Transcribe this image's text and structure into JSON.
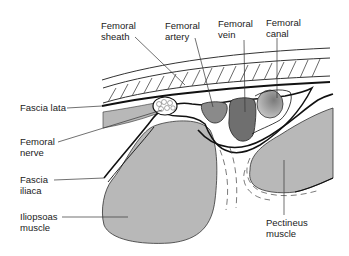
{
  "diagram": {
    "colors": {
      "muscle_fill": "#b8b8b8",
      "artery_fill": "#8a8a8a",
      "vein_fill": "#6f6f6f",
      "canal_fill": "#a0a0a0",
      "outline": "#111111",
      "leader": "#333333",
      "background": "#ffffff"
    },
    "labels": {
      "femoral_sheath": "Femoral\nsheath",
      "femoral_artery": "Femoral\nartery",
      "femoral_vein": "Femoral\nvein",
      "femoral_canal": "Femoral\ncanal",
      "fascia_lata": "Fascia lata",
      "femoral_nerve": "Femoral\nnerve",
      "fascia_iliaca": "Fascia\niliaca",
      "iliopsoas_muscle": "Iliopsoas\nmuscle",
      "pectineus_muscle": "Pectineus\nmuscle"
    }
  }
}
